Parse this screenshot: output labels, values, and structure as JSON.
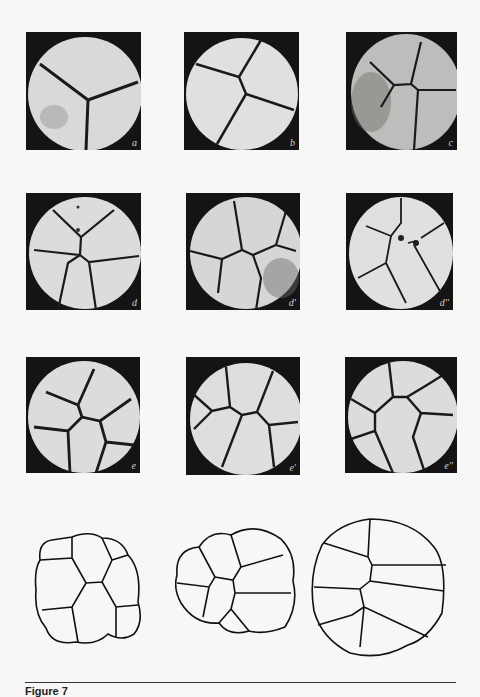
{
  "figure": {
    "caption_label": "Figure 7",
    "panels": [
      {
        "label": "a"
      },
      {
        "label": "b"
      },
      {
        "label": "c"
      },
      {
        "label": "d"
      },
      {
        "label": "d'"
      },
      {
        "label": "d''"
      },
      {
        "label": "e"
      },
      {
        "label": "e'"
      },
      {
        "label": "e''"
      }
    ],
    "drawings": [
      {
        "name": "cell-diagram-1"
      },
      {
        "name": "cell-diagram-2"
      },
      {
        "name": "cell-diagram-3"
      }
    ]
  }
}
